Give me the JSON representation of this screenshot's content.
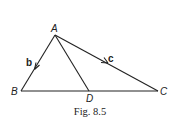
{
  "figure": {
    "caption": "Fig. 8.5",
    "points": {
      "A": {
        "label": "A",
        "x": 55,
        "y": 35
      },
      "B": {
        "label": "B",
        "x": 21,
        "y": 91
      },
      "C": {
        "label": "C",
        "x": 158,
        "y": 91
      },
      "D": {
        "label": "D",
        "x": 89,
        "y": 91
      }
    },
    "vectors": {
      "b": {
        "label": "b",
        "from": "A",
        "to": "B"
      },
      "c": {
        "label": "c",
        "from": "A",
        "to": "C"
      }
    },
    "segments": [
      "AB",
      "AC",
      "BC",
      "AD"
    ],
    "line_color": "#222222"
  }
}
